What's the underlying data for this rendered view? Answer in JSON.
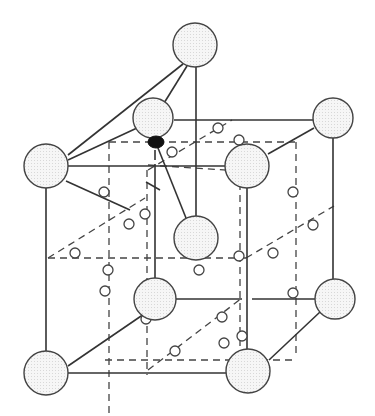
{
  "figure": {
    "type": "crystal-structure-unit-cell",
    "colors": {
      "line": "#333333",
      "atom_fill": "#f4f4f4",
      "stipple": "#cfcfcf",
      "dark_atom": "#111111",
      "background": "#ffffff"
    },
    "large_atoms": [
      {
        "id": "top",
        "cx": 195,
        "cy": 45,
        "r": 22
      },
      {
        "id": "upper-mid",
        "cx": 153,
        "cy": 118,
        "r": 20
      },
      {
        "id": "left-upper",
        "cx": 46,
        "cy": 166,
        "r": 22
      },
      {
        "id": "right-front-upper",
        "cx": 247,
        "cy": 166,
        "r": 22
      },
      {
        "id": "right-back-upper",
        "cx": 333,
        "cy": 118,
        "r": 20
      },
      {
        "id": "center-hanging",
        "cx": 196,
        "cy": 238,
        "r": 22
      },
      {
        "id": "back-left-lower",
        "cx": 155,
        "cy": 299,
        "r": 21
      },
      {
        "id": "right-back-lower",
        "cx": 335,
        "cy": 299,
        "r": 20
      },
      {
        "id": "bottom-left",
        "cx": 46,
        "cy": 373,
        "r": 22
      },
      {
        "id": "bottom-right",
        "cx": 248,
        "cy": 371,
        "r": 22
      }
    ],
    "dark_atom": {
      "cx": 156,
      "cy": 142,
      "rx": 8,
      "ry": 6
    },
    "small_atoms": [
      [
        218,
        128
      ],
      [
        239,
        140
      ],
      [
        172,
        152
      ],
      [
        293,
        192
      ],
      [
        104,
        192
      ],
      [
        145,
        214
      ],
      [
        129,
        224
      ],
      [
        75,
        253
      ],
      [
        108,
        270
      ],
      [
        199,
        270
      ],
      [
        239,
        256
      ],
      [
        273,
        253
      ],
      [
        313,
        225
      ],
      [
        105,
        291
      ],
      [
        293,
        293
      ],
      [
        146,
        319
      ],
      [
        222,
        317
      ],
      [
        242,
        336
      ],
      [
        175,
        351
      ],
      [
        224,
        343
      ]
    ],
    "solid_lines": [
      [
        183,
        64,
        68,
        155
      ],
      [
        187,
        66,
        161,
        108
      ],
      [
        196,
        67,
        196,
        247
      ],
      [
        68,
        160,
        137,
        128
      ],
      [
        68,
        166,
        226,
        166
      ],
      [
        174,
        120,
        333,
        120
      ],
      [
        268,
        154,
        314,
        128
      ],
      [
        154,
        138,
        186,
        218
      ],
      [
        155,
        150,
        155,
        160
      ],
      [
        155,
        164,
        155,
        290
      ],
      [
        146,
        182,
        160,
        190
      ],
      [
        66,
        181,
        130,
        210
      ],
      [
        46,
        188,
        46,
        351
      ],
      [
        333,
        138,
        333,
        279
      ],
      [
        247,
        188,
        247,
        349
      ],
      [
        68,
        366,
        147,
        312
      ],
      [
        68,
        373,
        226,
        373
      ],
      [
        176,
        299,
        242,
        299
      ],
      [
        252,
        299,
        315,
        299
      ],
      [
        269,
        360,
        320,
        312
      ]
    ],
    "dashed_lines": [
      [
        109,
        142,
        295,
        142
      ],
      [
        109,
        142,
        109,
        415
      ],
      [
        48,
        258,
        246,
        258
      ],
      [
        48,
        258,
        145,
        198
      ],
      [
        147,
        170,
        147,
        375
      ],
      [
        148,
        170,
        232,
        120
      ],
      [
        240,
        171,
        240,
        360
      ],
      [
        296,
        142,
        296,
        358
      ],
      [
        246,
        258,
        334,
        206
      ],
      [
        105,
        360,
        296,
        360
      ],
      [
        148,
        370,
        242,
        298
      ],
      [
        148,
        165,
        240,
        171
      ]
    ]
  }
}
